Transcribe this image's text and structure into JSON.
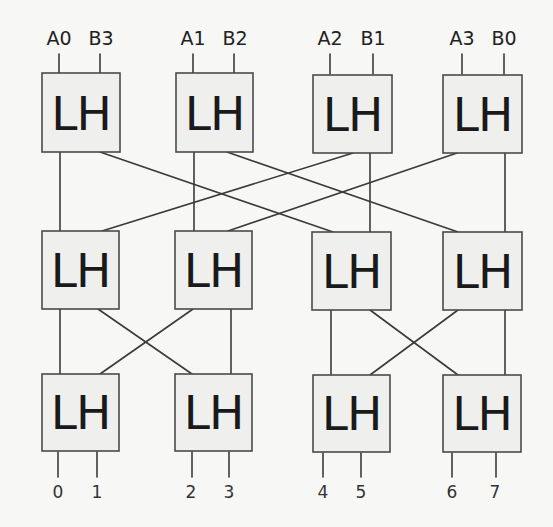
{
  "diagram": {
    "title": "",
    "type": "butterfly-network",
    "block_label": "LH",
    "inputs": [
      {
        "box": 0,
        "labels": [
          "A0",
          "B3"
        ]
      },
      {
        "box": 1,
        "labels": [
          "A1",
          "B2"
        ]
      },
      {
        "box": 2,
        "labels": [
          "A2",
          "B1"
        ]
      },
      {
        "box": 3,
        "labels": [
          "A3",
          "B0"
        ]
      }
    ],
    "outputs": [
      {
        "box": 0,
        "labels": [
          "0",
          "1"
        ]
      },
      {
        "box": 1,
        "labels": [
          "2",
          "3"
        ]
      },
      {
        "box": 2,
        "labels": [
          "4",
          "5"
        ]
      },
      {
        "box": 3,
        "labels": [
          "6",
          "7"
        ]
      }
    ],
    "rows": [
      {
        "name": "stage-1",
        "boxes": [
          "LH",
          "LH",
          "LH",
          "LH"
        ]
      },
      {
        "name": "stage-2",
        "boxes": [
          "LH",
          "LH",
          "LH",
          "LH"
        ]
      },
      {
        "name": "stage-3",
        "boxes": [
          "LH",
          "LH",
          "LH",
          "LH"
        ]
      }
    ],
    "connections": {
      "stage1_to_stage2": [
        {
          "from": [
            0,
            "left"
          ],
          "to": [
            0,
            "left"
          ]
        },
        {
          "from": [
            0,
            "right"
          ],
          "to": [
            2,
            "left"
          ]
        },
        {
          "from": [
            1,
            "left"
          ],
          "to": [
            1,
            "left"
          ]
        },
        {
          "from": [
            1,
            "right"
          ],
          "to": [
            3,
            "left"
          ]
        },
        {
          "from": [
            2,
            "left"
          ],
          "to": [
            0,
            "right"
          ]
        },
        {
          "from": [
            2,
            "right"
          ],
          "to": [
            2,
            "right"
          ]
        },
        {
          "from": [
            3,
            "left"
          ],
          "to": [
            1,
            "right"
          ]
        },
        {
          "from": [
            3,
            "right"
          ],
          "to": [
            3,
            "right"
          ]
        }
      ],
      "stage2_to_stage3": [
        {
          "from": [
            0,
            "left"
          ],
          "to": [
            0,
            "left"
          ]
        },
        {
          "from": [
            0,
            "right"
          ],
          "to": [
            1,
            "left"
          ]
        },
        {
          "from": [
            1,
            "left"
          ],
          "to": [
            0,
            "right"
          ]
        },
        {
          "from": [
            1,
            "right"
          ],
          "to": [
            1,
            "right"
          ]
        },
        {
          "from": [
            2,
            "left"
          ],
          "to": [
            2,
            "left"
          ]
        },
        {
          "from": [
            2,
            "right"
          ],
          "to": [
            3,
            "left"
          ]
        },
        {
          "from": [
            3,
            "left"
          ],
          "to": [
            2,
            "right"
          ]
        },
        {
          "from": [
            3,
            "right"
          ],
          "to": [
            3,
            "right"
          ]
        }
      ]
    },
    "colors": {
      "box_fill": "#efefee",
      "box_stroke": "#4a4a4a",
      "wire": "#3a3a3a",
      "text": "#1a1a1a",
      "background": "#f7f7f5"
    }
  }
}
